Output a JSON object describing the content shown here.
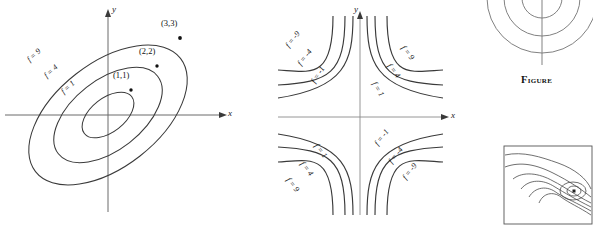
{
  "figure_caption": "Figure",
  "panel_left": {
    "name": "elliptic-contours",
    "axis_x_label": "x",
    "axis_y_label": "y",
    "contour_labels": [
      "f = 9",
      "f = 4",
      "f = 1"
    ],
    "point_labels": [
      "(3,3)",
      "(2,2)",
      "(1,1)"
    ]
  },
  "panel_middle": {
    "name": "hyperbolic-contours",
    "axis_x_label": "x",
    "axis_y_label": "y",
    "quadrant_upper_left": [
      "f = -9",
      "f = -4",
      "f = -1"
    ],
    "quadrant_upper_right": [
      "f = 9",
      "f = 4",
      "f = 1"
    ],
    "quadrant_lower_left": [
      "f = 1",
      "f = 4",
      "f = 9"
    ],
    "quadrant_lower_right": [
      "f = -1",
      "f = -4",
      "f = -9"
    ]
  },
  "panel_top_right": {
    "name": "partial-circular-contours"
  },
  "panel_bottom_right": {
    "name": "topographic-contour-map"
  },
  "colors": {
    "curve": "#3a3a3a",
    "axis": "#6b6b6b",
    "text": "#111111",
    "background": "#ffffff"
  }
}
